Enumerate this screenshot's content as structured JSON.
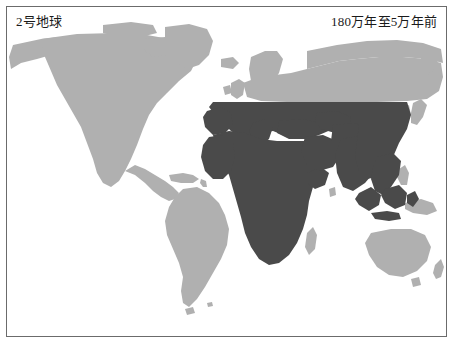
{
  "figure": {
    "title_left": "2号地球",
    "title_right": "180万年至5万年前",
    "frame_border_color": "#6b6b6b",
    "background_color": "#ffffff"
  },
  "map": {
    "projection_note": "world-map",
    "land_unoccupied_color": "#b0b0b0",
    "range_fill_color": "#4a4a4a",
    "ocean_color": "#ffffff",
    "regions": [
      {
        "name": "north-america",
        "shade": "light"
      },
      {
        "name": "greenland",
        "shade": "light"
      },
      {
        "name": "south-america",
        "shade": "light"
      },
      {
        "name": "northern-europe",
        "shade": "light"
      },
      {
        "name": "british-isles",
        "shade": "light"
      },
      {
        "name": "scandinavia",
        "shade": "light"
      },
      {
        "name": "northern-asia-siberia",
        "shade": "light"
      },
      {
        "name": "southern-europe",
        "shade": "dark"
      },
      {
        "name": "africa",
        "shade": "dark"
      },
      {
        "name": "middle-east",
        "shade": "dark"
      },
      {
        "name": "india",
        "shade": "dark"
      },
      {
        "name": "southern-china",
        "shade": "dark"
      },
      {
        "name": "southeast-asia",
        "shade": "dark"
      },
      {
        "name": "sumatra-java-borneo",
        "shade": "dark"
      },
      {
        "name": "japan",
        "shade": "light"
      },
      {
        "name": "australia",
        "shade": "light"
      },
      {
        "name": "new-zealand",
        "shade": "light"
      },
      {
        "name": "new-guinea",
        "shade": "light"
      }
    ],
    "range_northern_limit_y": 95,
    "range_eastern_limit_x": 400
  }
}
